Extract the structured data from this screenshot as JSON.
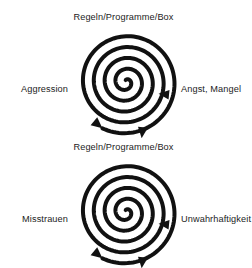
{
  "page": {
    "background_color": "#ffffff",
    "ink_color": "#111111",
    "text_color": "#1c1c1c"
  },
  "diagrams": [
    {
      "id": "top",
      "name": "aggression-spiral",
      "top_label": "Regeln/Programme/Box",
      "left_label": "Aggression",
      "right_label": "Angst, Mangel",
      "spiral": {
        "turns": 4.6,
        "direction": "clockwise-inward",
        "arrowheads": [
          "right-down",
          "left-up-outer",
          "bottom-left"
        ]
      }
    },
    {
      "id": "bottom",
      "name": "misstrauen-spiral",
      "top_label": "Regeln/Programme/Box",
      "left_label": "Misstrauen",
      "right_label": "Unwahrhaftigkeit",
      "spiral": {
        "turns": 4.6,
        "direction": "clockwise-inward",
        "arrowheads": [
          "right-down",
          "left-up-outer",
          "bottom-left"
        ]
      }
    }
  ]
}
